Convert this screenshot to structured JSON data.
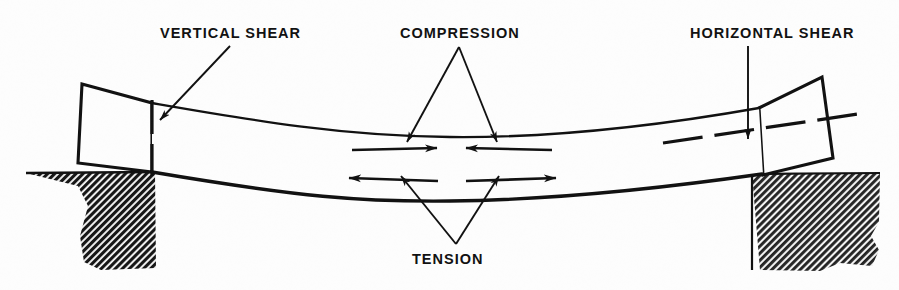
{
  "figure": {
    "background_color": "#fcfcfc",
    "ink_color": "#111111",
    "width": 899,
    "height": 290
  },
  "labels": {
    "vertical_shear": "VERTICAL SHEAR",
    "compression": "COMPRESSION",
    "horizontal_shear": "HORIZONTAL SHEAR",
    "tension": "TENSION"
  },
  "diagram_data": {
    "type": "engineering-diagram",
    "subject": "Simply supported beam in bending showing internal stresses",
    "elements": [
      {
        "name": "left-support-block",
        "kind": "hatched-rectangle",
        "x": 25,
        "y": 172,
        "width": 131,
        "height": 98,
        "hatch_angle_deg": 45,
        "fill": "#1a1a1a"
      },
      {
        "name": "right-support-block",
        "kind": "hatched-rectangle",
        "x": 750,
        "y": 173,
        "width": 131,
        "height": 99,
        "hatch_angle_deg": 45,
        "fill": "#2a2a2a"
      },
      {
        "name": "beam-top-edge",
        "kind": "curve",
        "description": "Upper fibre of the sagging beam, concave upward",
        "points": [
          [
            152,
            103
          ],
          [
            300,
            123
          ],
          [
            450,
            137
          ],
          [
            600,
            128
          ],
          [
            760,
            108
          ]
        ]
      },
      {
        "name": "beam-bottom-edge",
        "kind": "curve",
        "description": "Lower fibre of the sagging beam, concave upward, drawn heavier",
        "points": [
          [
            152,
            172
          ],
          [
            300,
            189
          ],
          [
            450,
            200
          ],
          [
            600,
            192
          ],
          [
            760,
            174
          ]
        ]
      },
      {
        "name": "left-beam-end-face",
        "kind": "quadrilateral",
        "description": "Tilted left end block of the beam rotated by the deflection",
        "points": [
          [
            82,
            84
          ],
          [
            152,
            103
          ],
          [
            152,
            172
          ],
          [
            78,
            163
          ]
        ]
      },
      {
        "name": "right-beam-end-face",
        "kind": "quadrilateral",
        "description": "Tilted right end block of the beam rotated by the deflection",
        "points": [
          [
            760,
            108
          ],
          [
            822,
            77
          ],
          [
            833,
            158
          ],
          [
            762,
            174
          ]
        ]
      },
      {
        "name": "vertical-shear-dashed-line",
        "kind": "dashed-line",
        "orientation": "vertical",
        "x1": 152,
        "y1": 100,
        "x2": 152,
        "y2": 176,
        "dash_count": 2
      },
      {
        "name": "horizontal-shear-dashed-line",
        "kind": "dashed-line",
        "orientation": "sloped",
        "x1": 663,
        "y1": 143,
        "x2": 858,
        "y2": 114,
        "dash_count": 4
      },
      {
        "name": "compression-arrow-left",
        "kind": "arrow",
        "direction": "right",
        "x1": 352,
        "y1": 150,
        "x2": 437,
        "y2": 148,
        "note": "Upper fibres pushed toward each other"
      },
      {
        "name": "compression-arrow-right",
        "kind": "arrow",
        "direction": "left",
        "x1": 552,
        "y1": 150,
        "x2": 466,
        "y2": 148,
        "note": "Upper fibres pushed toward each other"
      },
      {
        "name": "tension-arrow-left",
        "kind": "arrow",
        "direction": "left",
        "x1": 438,
        "y1": 182,
        "x2": 349,
        "y2": 179,
        "note": "Lower fibres pulled apart"
      },
      {
        "name": "tension-arrow-right",
        "kind": "arrow",
        "direction": "right",
        "x1": 466,
        "y1": 182,
        "x2": 556,
        "y2": 179,
        "note": "Lower fibres pulled apart"
      },
      {
        "name": "leader-vertical-shear",
        "kind": "leader-arrow",
        "from": [
          228,
          45
        ],
        "to": [
          157,
          118
        ]
      },
      {
        "name": "leader-compression-left",
        "kind": "leader-arrow",
        "from": [
          458,
          46
        ],
        "to": [
          409,
          140
        ]
      },
      {
        "name": "leader-compression-right",
        "kind": "leader-arrow",
        "from": [
          458,
          46
        ],
        "to": [
          494,
          140
        ]
      },
      {
        "name": "leader-horizontal-shear",
        "kind": "leader-arrow",
        "from": [
          748,
          46
        ],
        "to": [
          748,
          137
        ]
      },
      {
        "name": "leader-tension-left",
        "kind": "leader-arrow",
        "from": [
          455,
          243
        ],
        "to": [
          403,
          178
        ]
      },
      {
        "name": "leader-tension-right",
        "kind": "leader-arrow",
        "from": [
          455,
          243
        ],
        "to": [
          497,
          178
        ]
      }
    ]
  }
}
